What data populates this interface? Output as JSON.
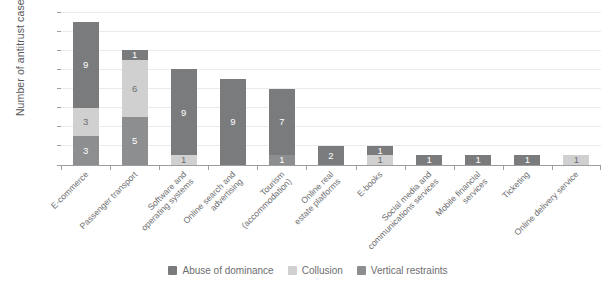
{
  "chart_data": {
    "type": "bar",
    "subtype": "stacked-vertical",
    "title": "",
    "xlabel": "",
    "ylabel": "Number of antitrust cases",
    "ylim": [
      0,
      16
    ],
    "yticks": [
      0,
      2,
      4,
      6,
      8,
      10,
      12,
      14,
      16
    ],
    "ytick_labels": [
      "0",
      "2",
      "4",
      "6",
      "8",
      "10",
      "12",
      "14",
      "16"
    ],
    "grid": true,
    "legend_position": "bottom",
    "categories": [
      "E-commerce",
      "Passenger transport",
      "Software and operating systems",
      "Online search and advertising",
      "Tourism (accommodation)",
      "Online real estate platforms",
      "E-books",
      "Social media and communications services",
      "Mobile financial services",
      "Ticketing",
      "Online delivery service"
    ],
    "category_lines": [
      [
        "E-commerce"
      ],
      [
        "Passenger transport"
      ],
      [
        "Software and",
        "operating systems"
      ],
      [
        "Online search and",
        "advertising"
      ],
      [
        "Tourism",
        "(accommodation)"
      ],
      [
        "Online real",
        "estate platforms"
      ],
      [
        "E-books"
      ],
      [
        "Social media and",
        "communications services"
      ],
      [
        "Mobile financial",
        "services"
      ],
      [
        "Ticketing"
      ],
      [
        "Online delivery service"
      ]
    ],
    "series": [
      {
        "name": "Abuse of dominance",
        "color": "#7a7b7d",
        "values": [
          9,
          1,
          9,
          9,
          7,
          2,
          1,
          1,
          1,
          1,
          0
        ]
      },
      {
        "name": "Collusion",
        "color": "#cfd0cf",
        "values": [
          3,
          6,
          1,
          0,
          0,
          0,
          1,
          0,
          0,
          0,
          1
        ]
      },
      {
        "name": "Vertical restraints",
        "color": "#8d8e90",
        "values": [
          3,
          5,
          0,
          0,
          1,
          0,
          0,
          0,
          0,
          0,
          0
        ]
      }
    ],
    "stack_order_bottom_to_top": [
      "Vertical restraints",
      "Collusion",
      "Abuse of dominance"
    ],
    "totals": [
      15,
      12,
      10,
      9,
      8,
      2,
      2,
      1,
      1,
      1,
      1
    ],
    "colors": {
      "abuse_of_dominance": "#7a7b7d",
      "collusion": "#cfd0cf",
      "vertical_restraints": "#8d8e90",
      "axis": "#9d9d9f",
      "grid": "#eceaea",
      "text": "#6d6e70",
      "background": "#ffffff"
    }
  },
  "legend": {
    "items": [
      {
        "label": "Abuse of dominance",
        "color": "#7a7b7d"
      },
      {
        "label": "Collusion",
        "color": "#cfd0cf"
      },
      {
        "label": "Vertical restraints",
        "color": "#8d8e90"
      }
    ]
  }
}
